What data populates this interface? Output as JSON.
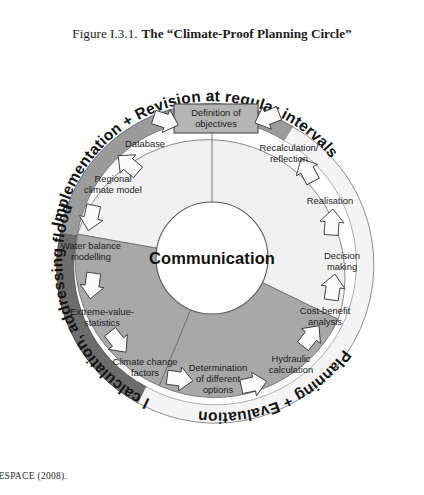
{
  "figure": {
    "number": "Figure I.3.1.",
    "name": "The “Climate-Proof Planning Circle”"
  },
  "center": {
    "label": "Communication"
  },
  "objective_box": {
    "line1": "Definition of",
    "line2": "objectives"
  },
  "outer_ring": {
    "segments": [
      {
        "id": "implementation",
        "label": "Implementation + Revision at regular intervals",
        "color": "#9b9b9b"
      },
      {
        "id": "planning",
        "label": "Planning + Evaluation",
        "color": "#f2f2f2"
      },
      {
        "id": "analytical",
        "label": "Analytical calculation, addressing flood risk + CC",
        "color": "#6d6d6d"
      }
    ]
  },
  "sectors": [
    {
      "id": "implementation-sector",
      "color": "#f0f0f0"
    },
    {
      "id": "planning-sector",
      "color": "#a8a8a8"
    },
    {
      "id": "analytical-sector",
      "color": "#a8a8a8"
    }
  ],
  "nodes": [
    {
      "id": "database",
      "lines": [
        "Database"
      ]
    },
    {
      "id": "regional-climate-model",
      "lines": [
        "Regional",
        "climate model"
      ]
    },
    {
      "id": "water-balance-modelling",
      "lines": [
        "Water balance",
        "modelling"
      ]
    },
    {
      "id": "extreme-value-statistics",
      "lines": [
        "Extreme-value-",
        "statistics"
      ]
    },
    {
      "id": "climate-change-factors",
      "lines": [
        "Climate change",
        "factors"
      ]
    },
    {
      "id": "determination-of-different-options",
      "lines": [
        "Determination",
        "of different",
        "options"
      ]
    },
    {
      "id": "hydraulic-calculation",
      "lines": [
        "Hydraulic",
        "calculation"
      ]
    },
    {
      "id": "cost-benefit-analysis",
      "lines": [
        "Cost-benefit",
        "analysis"
      ]
    },
    {
      "id": "decision-making",
      "lines": [
        "Decision",
        "making"
      ]
    },
    {
      "id": "realisation",
      "lines": [
        "Realisation"
      ]
    },
    {
      "id": "recalculation-reflection",
      "lines": [
        "Recalculation/",
        "reflection"
      ]
    }
  ],
  "source": {
    "label": "e:",
    "text": "ESPACE (2008)."
  },
  "colors": {
    "ring_dark": "#6d6d6d",
    "ring_mid": "#9b9b9b",
    "ring_light": "#f2f2f2",
    "sector_mid": "#a8a8a8",
    "sector_light": "#f0f0f0",
    "center_fill": "#ffffff",
    "outline": "#555555",
    "text": "#1a1a1a"
  }
}
